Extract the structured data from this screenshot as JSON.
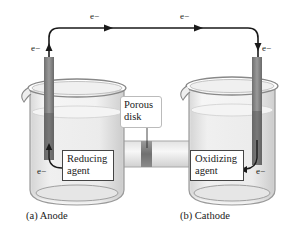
{
  "diagram": {
    "type": "galvanic-cell",
    "electron_label": "e−",
    "electron_labels": [
      {
        "id": "wire-left-top",
        "text": "e−"
      },
      {
        "id": "wire-right-top",
        "text": "e−"
      },
      {
        "id": "anode-electrode-up",
        "text": "e−"
      },
      {
        "id": "cathode-electrode-down",
        "text": "e−"
      },
      {
        "id": "anode-solution",
        "text": "e−"
      },
      {
        "id": "cathode-solution",
        "text": "e−"
      }
    ],
    "porous_disk": {
      "line1": "Porous",
      "line2": "disk"
    },
    "anode": {
      "agent_line1": "Reducing",
      "agent_line2": "agent",
      "caption": "(a) Anode"
    },
    "cathode": {
      "agent_line1": "Oxidizing",
      "agent_line2": "agent",
      "caption": "(b) Cathode"
    },
    "colors": {
      "wire": "#1a1a1a",
      "electrode": "#8a8a8a",
      "electrode_submerged": "#6e6e6e",
      "glass_outline": "#9a9a9a",
      "solution": "#ececec",
      "porous_disk": "#7a7a7a"
    }
  }
}
